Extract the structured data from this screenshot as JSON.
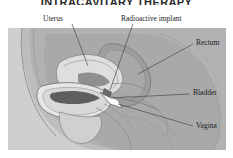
{
  "figure": {
    "title": "INTRACAVITARY THERAPY",
    "title_clipped": true,
    "type": "medical-anatomical-illustration",
    "view": "sagittal section of female pelvis",
    "labels": [
      {
        "id": "uterus",
        "text": "Uterus"
      },
      {
        "id": "implant",
        "text": "Radioactive implant"
      },
      {
        "id": "rectum",
        "text": "Rectum"
      },
      {
        "id": "bladder",
        "text": "Bladder"
      },
      {
        "id": "vagina",
        "text": "Vagina"
      }
    ],
    "colors": {
      "page_background": "#ffffff",
      "title_text": "#2b2b2b",
      "label_text": "#1c1c1c",
      "leader_line": "#4a4a4a",
      "body_light": "#c9c9c9",
      "body_mid": "#b4b4b4",
      "body_dark": "#9a9a9a",
      "organ_light": "#dcdcdc",
      "organ_pale": "#e8e8e8",
      "cavity_dark": "#5c5c5c",
      "implant_white": "#fbfbfb",
      "outline": "#7a7a7a"
    }
  }
}
